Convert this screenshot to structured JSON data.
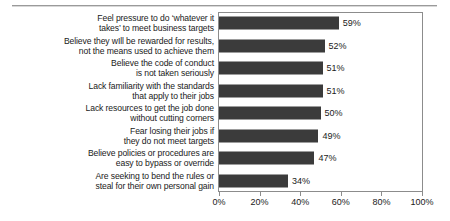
{
  "chart_data": {
    "type": "bar",
    "orientation": "horizontal",
    "title": "",
    "subtitle": "",
    "xlabel": "",
    "ylabel": "",
    "xlim": [
      0,
      100
    ],
    "grid": false,
    "legend": null,
    "tick_suffix": "%",
    "bar_color": "#3b3b3b",
    "axis_color": "#8c8c8c",
    "xticks": [
      {
        "value": 0,
        "label": "0%"
      },
      {
        "value": 20,
        "label": "20%"
      },
      {
        "value": 40,
        "label": "40%"
      },
      {
        "value": 60,
        "label": "60%"
      },
      {
        "value": 80,
        "label": "80%"
      },
      {
        "value": 100,
        "label": "100%"
      }
    ],
    "categories": [
      "Feel pressure to do ‘whatever it\ntakes’ to meet business targets",
      "Believe they wIll be rewarded for results,\nnot the means used to achieve them",
      "Believe the code of conduct\nis not taken seriously",
      "Lack familiarity with the standards\nthat apply to their jobs",
      "Lack resources to get the job done\nwithout cutting corners",
      "Fear losing their jobs if\nthey do not meet targets",
      "Believe policies or procedures are\neasy to bypass or override",
      "Are seeking to bend the rules or\nsteal for their own personal gain"
    ],
    "values": [
      59,
      52,
      51,
      51,
      50,
      49,
      47,
      34
    ],
    "value_labels": [
      "59%",
      "52%",
      "51%",
      "51%",
      "50%",
      "49%",
      "47%",
      "34%"
    ]
  }
}
